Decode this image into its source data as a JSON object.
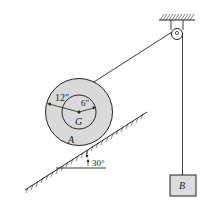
{
  "diagram": {
    "labels": {
      "outer_radius": "12\"",
      "inner_radius": "6\"",
      "center": "G",
      "spool": "A",
      "block": "B",
      "angle": "30°"
    },
    "colors": {
      "ink": "#222222",
      "spool_fill": "#d9d9d9",
      "block_fill": "#dcdcdc",
      "background": "#ffffff"
    }
  }
}
